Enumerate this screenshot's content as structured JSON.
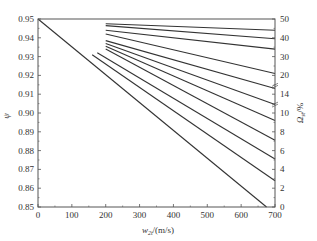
{
  "chart_data": {
    "type": "line",
    "title": "",
    "xlabel": "w_2t/(m/s)",
    "ylabel": "ψ",
    "y2label": "Ω_st/%",
    "xlim": [
      0,
      700
    ],
    "ylim": [
      0.85,
      0.95
    ],
    "grid": false,
    "legend": "none",
    "x_ticks": [
      0,
      100,
      200,
      300,
      400,
      500,
      600,
      700
    ],
    "y_ticks": [
      "0.85",
      "0.86",
      "0.87",
      "0.88",
      "0.89",
      "0.90",
      "0.91",
      "0.92",
      "0.93",
      "0.94",
      "0.95"
    ],
    "y2_ticks": [
      "0",
      "2",
      "4",
      "6",
      "8",
      "10",
      "14",
      "20",
      "30",
      "40",
      "50"
    ],
    "series": [
      {
        "name": "main",
        "points": [
          [
            0,
            0.95
          ],
          [
            675,
            0.85
          ]
        ]
      },
      {
        "name": "Ω line 1",
        "points": [
          [
            200,
            0.9475
          ],
          [
            700,
            0.944
          ]
        ]
      },
      {
        "name": "Ω line 2",
        "points": [
          [
            200,
            0.9465
          ],
          [
            700,
            0.9395
          ]
        ]
      },
      {
        "name": "Ω line 3",
        "points": [
          [
            200,
            0.944
          ],
          [
            700,
            0.934
          ]
        ]
      },
      {
        "name": "Ω line 4",
        "points": [
          [
            200,
            0.942
          ],
          [
            700,
            0.921
          ]
        ]
      },
      {
        "name": "Ω line 5",
        "points": [
          [
            200,
            0.9385
          ],
          [
            700,
            0.913
          ]
        ]
      },
      {
        "name": "Ω line 6",
        "points": [
          [
            200,
            0.937
          ],
          [
            700,
            0.9045
          ]
        ]
      },
      {
        "name": "Ω line 7",
        "points": [
          [
            200,
            0.9355
          ],
          [
            700,
            0.896
          ]
        ]
      },
      {
        "name": "Ω line 8",
        "points": [
          [
            200,
            0.934
          ],
          [
            700,
            0.8855
          ]
        ]
      },
      {
        "name": "Ω line 9",
        "points": [
          [
            175,
            0.932
          ],
          [
            700,
            0.8755
          ]
        ]
      },
      {
        "name": "Ω line 10",
        "points": [
          [
            160,
            0.931
          ],
          [
            700,
            0.864
          ]
        ]
      }
    ]
  },
  "labels": {
    "xlabel_main": "w",
    "xlabel_sub": "2t",
    "xlabel_unit": "/(m/s)",
    "ylabel": "ψ",
    "y2label_main": "Ω",
    "y2label_sub": "st",
    "y2label_unit": "/%"
  }
}
